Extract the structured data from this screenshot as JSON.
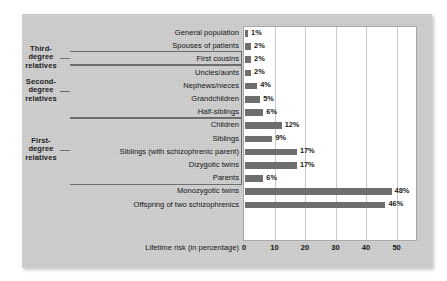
{
  "chart_data": {
    "type": "bar",
    "orientation": "horizontal",
    "title": "",
    "xlabel": "Lifetime risk (in percentage)",
    "ylabel": "",
    "xlim": [
      0,
      57
    ],
    "xticks": [
      0,
      10,
      20,
      30,
      40,
      50
    ],
    "xtick_labels": [
      "0",
      "10",
      "20",
      "30",
      "40",
      "50"
    ],
    "grid": "vertical",
    "legend": "none",
    "bar_color": "#6e6e6e",
    "panel_color": "#cfcfcf",
    "plot_bg": "#ffffff",
    "categories": [
      "General population",
      "Spouses of patients",
      "First cousins",
      "Uncles/aunts",
      "Nephews/nieces",
      "Grandchildren",
      "Half-siblings",
      "Children",
      "Siblings",
      "Siblings (with schizophrenic parent)",
      "Dizygotic twins",
      "Parents",
      "Monozygotic twins",
      "Offspring of two schizophrenics"
    ],
    "values": [
      1,
      2,
      2,
      2,
      4,
      5,
      6,
      12,
      9,
      17,
      17,
      6,
      48,
      46
    ],
    "value_labels": [
      "1%",
      "2%",
      "2%",
      "2%",
      "4%",
      "5%",
      "6%",
      "12%",
      "9%",
      "17%",
      "17%",
      "6%",
      "48%",
      "46%"
    ]
  },
  "groups": [
    {
      "id": "third-degree",
      "label": "Third-\ndegree\nrelatives",
      "first_row": 2,
      "last_row": 2
    },
    {
      "id": "second-degree",
      "label": "Second-\ndegree\nrelatives",
      "first_row": 3,
      "last_row": 6
    },
    {
      "id": "first-degree",
      "label": "First-\ndegree\nrelatives",
      "first_row": 7,
      "last_row": 11
    }
  ]
}
